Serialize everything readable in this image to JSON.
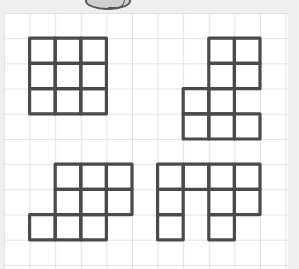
{
  "diagram": {
    "grid": {
      "columns": 11,
      "rows": 10
    },
    "stroke_color": "#4a4a4a",
    "grid_line_color": "#e2e2e2",
    "paper_color": "#ffffff",
    "background_color": "#efefef",
    "top_object": "partial-cut-off-drawing",
    "shapes": [
      {
        "name": "shape-a-square",
        "cells": [
          [
            1,
            1
          ],
          [
            2,
            1
          ],
          [
            3,
            1
          ],
          [
            1,
            2
          ],
          [
            2,
            2
          ],
          [
            3,
            2
          ],
          [
            1,
            3
          ],
          [
            2,
            3
          ],
          [
            3,
            3
          ]
        ]
      },
      {
        "name": "shape-b",
        "cells": [
          [
            8,
            1
          ],
          [
            9,
            1
          ],
          [
            8,
            2
          ],
          [
            9,
            2
          ],
          [
            7,
            3
          ],
          [
            8,
            3
          ],
          [
            7,
            4
          ],
          [
            8,
            4
          ],
          [
            9,
            4
          ]
        ]
      },
      {
        "name": "shape-c",
        "cells": [
          [
            2,
            6
          ],
          [
            3,
            6
          ],
          [
            4,
            6
          ],
          [
            2,
            7
          ],
          [
            3,
            7
          ],
          [
            4,
            7
          ],
          [
            1,
            8
          ],
          [
            2,
            8
          ],
          [
            3,
            8
          ]
        ]
      },
      {
        "name": "shape-d",
        "cells": [
          [
            6,
            6
          ],
          [
            7,
            6
          ],
          [
            8,
            6
          ],
          [
            9,
            6
          ],
          [
            6,
            7
          ],
          [
            8,
            7
          ],
          [
            9,
            7
          ],
          [
            6,
            8
          ],
          [
            8,
            8
          ]
        ]
      }
    ]
  }
}
